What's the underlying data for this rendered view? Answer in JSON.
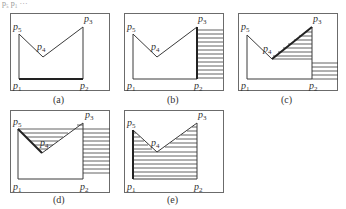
{
  "header_fragment": "p5 p1 ...",
  "point_labels": {
    "p1": "p",
    "p2": "p",
    "p3": "p",
    "p4": "p",
    "p5": "p",
    "s1": "1",
    "s2": "2",
    "s3": "3",
    "s4": "4",
    "s5": "5"
  },
  "panels": [
    {
      "id": "a",
      "caption": "(a)",
      "description": "Polygon p1-p2-p3-p4-p5 with edge p1p2 highlighted"
    },
    {
      "id": "b",
      "caption": "(b)",
      "description": "Region right of edge p2p3 hatched"
    },
    {
      "id": "c",
      "caption": "(c)",
      "description": "Triangle under edge p3p4 hatched plus strip below"
    },
    {
      "id": "d",
      "caption": "(d)",
      "description": "Region between p5 line and edges p5p4, p4p3 hatched"
    },
    {
      "id": "e",
      "caption": "(e)",
      "description": "Polygon interior fully hatched"
    }
  ]
}
